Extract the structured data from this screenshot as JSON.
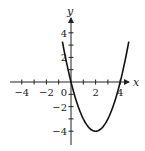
{
  "chart_data": {
    "type": "line",
    "title": "",
    "function": "y = x^2 - 4x",
    "xlabel": "x",
    "ylabel": "y",
    "xlim": [
      -5,
      5
    ],
    "ylim": [
      -5,
      5
    ],
    "x_ticks": [
      -4,
      -3,
      -2,
      -1,
      1,
      2,
      3,
      4
    ],
    "y_ticks": [
      -4,
      -3,
      -2,
      -1,
      1,
      2,
      3,
      4
    ],
    "x_tick_labels": [
      "-4",
      "-2",
      "0",
      "2",
      "4"
    ],
    "y_tick_labels": [
      "4",
      "2",
      "-2",
      "-4"
    ],
    "grid": false,
    "series": [
      {
        "name": "parabola",
        "x_range": [
          -0.7,
          4.7
        ],
        "vertex": [
          2,
          -4
        ],
        "zeros": [
          0,
          4
        ],
        "color": "#111111"
      }
    ]
  }
}
